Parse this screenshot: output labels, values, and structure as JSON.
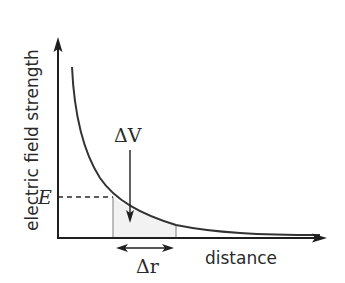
{
  "diagram": {
    "axes": {
      "y_label": "electric field strength",
      "x_label": "distance"
    },
    "annotations": {
      "field_value_label": "E",
      "potential_difference_label": "ΔV",
      "distance_interval_label": "Δr"
    },
    "colors": {
      "ink": "#2a2a2a",
      "curve": "#333333",
      "guide_lines": "#9a9a9a",
      "shaded_area": "#f2f2f2"
    }
  }
}
